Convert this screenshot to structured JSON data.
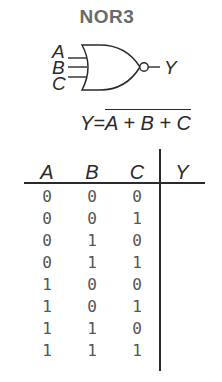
{
  "title": "NOR3",
  "gate": {
    "type": "NOR",
    "inputs": [
      "A",
      "B",
      "C"
    ],
    "output": "Y"
  },
  "equation": {
    "lhs": "Y",
    "equals": "=",
    "rhs_overlined": "A + B + C"
  },
  "truth_table": {
    "headers": [
      "A",
      "B",
      "C",
      "Y"
    ],
    "rows": [
      [
        "0",
        "0",
        "0",
        ""
      ],
      [
        "0",
        "0",
        "1",
        ""
      ],
      [
        "0",
        "1",
        "0",
        ""
      ],
      [
        "0",
        "1",
        "1",
        ""
      ],
      [
        "1",
        "0",
        "0",
        ""
      ],
      [
        "1",
        "0",
        "1",
        ""
      ],
      [
        "1",
        "1",
        "0",
        ""
      ],
      [
        "1",
        "1",
        "1",
        ""
      ]
    ]
  },
  "colors": {
    "title": "#6a6a6a",
    "ink": "#2a2a2a",
    "digits": "#555555"
  }
}
